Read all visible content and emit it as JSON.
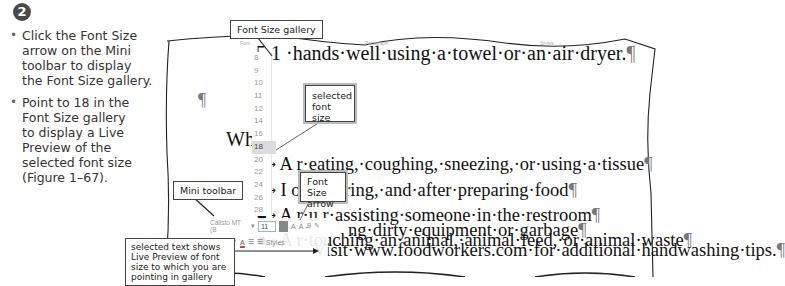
{
  "step": {
    "number": "2"
  },
  "instructions": [
    {
      "lines": [
        "Click the Font Size",
        "arrow on the Mini",
        "toolbar to display",
        "the Font Size gallery."
      ]
    },
    {
      "lines": [
        "Point to 18 in the",
        "Font Size gallery",
        "to display a Live",
        "Preview of the",
        "selected font size",
        "(Figure 1–67)."
      ]
    }
  ],
  "ribbon": {
    "group_font": "Font",
    "group_paragraph": "Paragraph",
    "group_styles": "Styles"
  },
  "document": {
    "line1": "5.1   ·hands·well·using·a·towel·or·an·air·dryer.",
    "pilcrow": "¶",
    "heading": "Whe",
    "bullets": [
      {
        "lead": "A",
        "text": "r·eating,·coughing,·sneezing,·or·using·a·tissue"
      },
      {
        "lead": "I",
        "text": "ore,·during,·and·after·preparing·food"
      },
      {
        "lead": "A",
        "text": "r·u        r·assisting·someone·in·the·restroom"
      },
      {
        "lead": "A",
        "text": "r·touching·an·animal,·animal·feed,·or·animal·waste"
      },
      {
        "lead": "",
        "text": "ng·dirty·equipment·or·garbage"
      }
    ],
    "visit": "Visit·www.foodworkers.com·for·additional·handwashing·tips."
  },
  "font_size_gallery": {
    "items": [
      "8",
      "9",
      "10",
      "11",
      "12",
      "14",
      "16",
      "18",
      "20",
      "22",
      "24",
      "26",
      "28",
      "36",
      "48",
      "72"
    ],
    "selected": "18"
  },
  "mini_toolbar": {
    "font_name": "Calisto MT (B",
    "font_size": "11",
    "grow": "A",
    "shrink": "A",
    "clear_format": "Ꭿ",
    "format_painter": "✎",
    "bold": "B",
    "italic": "I",
    "underline": "U",
    "highlight": "✐",
    "font_color": "A",
    "bullets": "☰",
    "numbering": "☰",
    "styles": "Styles"
  },
  "callouts": {
    "font_size_gallery": "Font Size gallery",
    "selected_font_size": [
      "selected",
      "font size"
    ],
    "font_size_arrow": [
      "Font Size",
      "arrow"
    ],
    "mini_toolbar": "Mini toolbar",
    "live_preview": [
      "selected text shows",
      "Live Preview of font",
      "size to which you are",
      "pointing in gallery"
    ]
  }
}
